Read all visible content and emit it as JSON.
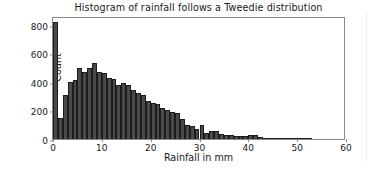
{
  "chart_data": {
    "type": "bar",
    "title": "Histogram of rainfall follows a Tweedie distribution",
    "xlabel": "Rainfall in mm",
    "ylabel": "Count",
    "xlim": [
      0,
      60
    ],
    "ylim": [
      0,
      860
    ],
    "grid": false,
    "legend": null,
    "bin_width": 1,
    "bar_color": "#4a4a4a",
    "bar_edge_color": "#1c1c1c",
    "xticks": [
      0,
      10,
      20,
      30,
      40,
      50,
      60
    ],
    "yticks": [
      0,
      200,
      400,
      600,
      800
    ],
    "categories": [
      0,
      1,
      2,
      3,
      4,
      5,
      6,
      7,
      8,
      9,
      10,
      11,
      12,
      13,
      14,
      15,
      16,
      17,
      18,
      19,
      20,
      21,
      22,
      23,
      24,
      25,
      26,
      27,
      28,
      29,
      30,
      31,
      32,
      33,
      34,
      35,
      36,
      37,
      38,
      39,
      40,
      41,
      42,
      43,
      44,
      45,
      46,
      47,
      48,
      49,
      50,
      51,
      52,
      53,
      54,
      55,
      56,
      57,
      58,
      59
    ],
    "values": [
      815,
      145,
      310,
      400,
      410,
      495,
      470,
      500,
      530,
      470,
      460,
      425,
      420,
      375,
      390,
      375,
      345,
      320,
      305,
      265,
      250,
      245,
      215,
      200,
      190,
      180,
      140,
      95,
      90,
      70,
      95,
      45,
      55,
      55,
      35,
      30,
      25,
      22,
      20,
      20,
      25,
      25,
      12,
      8,
      6,
      5,
      4,
      3,
      3,
      6,
      3,
      2,
      1,
      0,
      0,
      0,
      0,
      0,
      0,
      0
    ]
  },
  "axes": {
    "y_tick_labels": [
      "0",
      "200",
      "400",
      "600",
      "800"
    ],
    "x_tick_labels": [
      "0",
      "10",
      "20",
      "30",
      "40",
      "50",
      "60"
    ]
  }
}
